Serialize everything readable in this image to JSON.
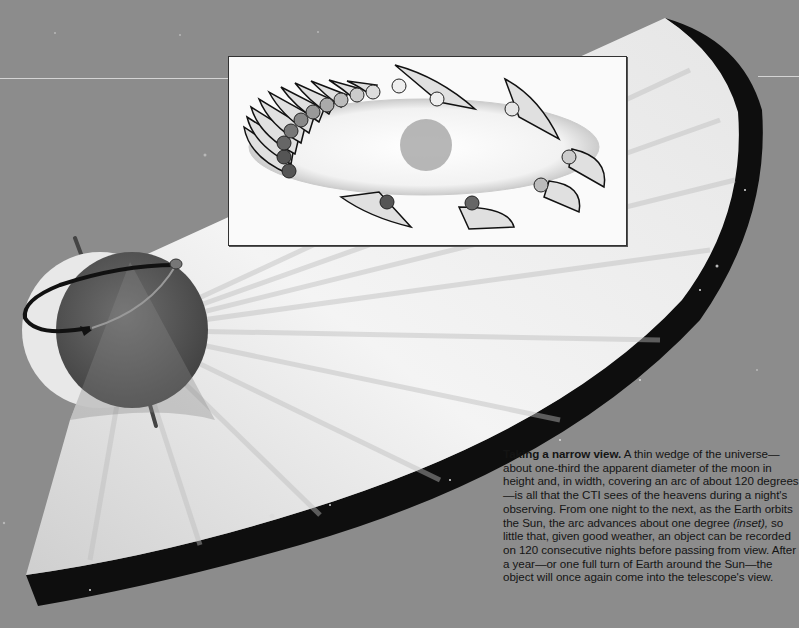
{
  "figure": {
    "title": "Taking a narrow view.",
    "caption_before_inset": " A thin wedge of the universe—about one-third the apparent diameter of the moon in height and, in width, covering an arc of about 120 degrees—is all that the CTI sees of the heavens during a night's observing. From one night to the next, as the Earth orbits the Sun, the arc advances about one degree ",
    "caption_inset_ref": "(inset),",
    "caption_after_inset": " so little that, given good weather, an object can be recorded on 120 consecutive nights before passing from view. After a year—or one full turn of Earth around the Sun—the object will once again come into the telescope's view.",
    "caption_lines": [
      "Taking a narrow view. A thin wedge of the",
      "universe—about one-third the apparent diameter",
      "of the moon in height and, in width, covering an",
      "arc of about 120 degrees—is all that the CTI sees",
      "of the heavens during a night's observing. From",
      "one night to the next, as the Earth orbits the Sun,",
      "the arc advances about one degree (inset), so",
      "little that, given good weather, an object can be",
      "recorded on 120 consecutive nights before",
      "passing from view. After a year—or one full turn",
      "of Earth around the Sun—the object will once",
      "again come into the telescope's view."
    ]
  },
  "elements": {
    "earth": "rotating Earth globe with rotation arrow and axis",
    "wedge": "120-degree wedge of sky swept by telescope",
    "inset": "Earth orbit around the Sun with nightly observing wedges",
    "sun": "central Sun in inset"
  },
  "colors": {
    "background": "#8c8c8c",
    "wedge_light": "#f2f2f2",
    "wedge_rim": "#0e0e0e",
    "earth_dark": "#5a5a5a",
    "inset_bg": "#fafafa",
    "text": "#141414"
  }
}
